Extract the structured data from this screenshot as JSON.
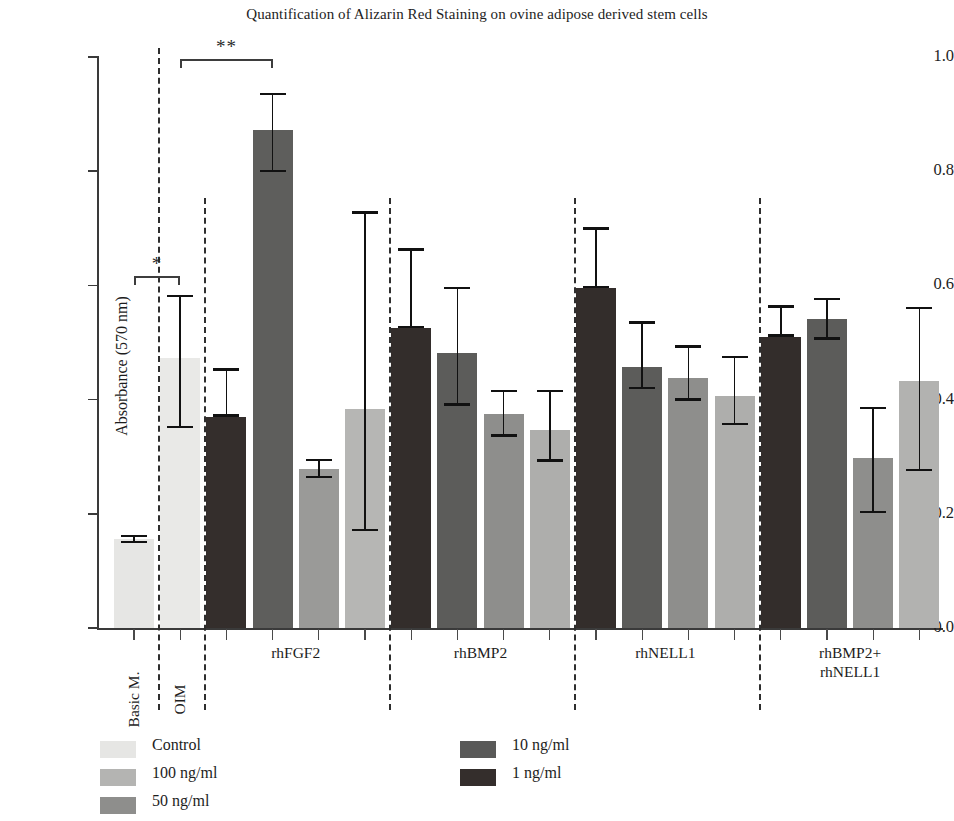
{
  "chart_data": {
    "type": "bar",
    "title": "Quantification of Alizarin Red Staining on ovine adipose derived stem cells",
    "xlabel": "",
    "ylabel": "Absorbance (570 nm)",
    "ylim": [
      0.0,
      1.0
    ],
    "ytick_labels": [
      "1.0",
      "0.8",
      "0.6",
      "0.4",
      "0.2",
      "0.0"
    ],
    "ytick_values": [
      1.0,
      0.8,
      0.6,
      0.4,
      0.2,
      0.0
    ],
    "grid": false,
    "legend_position": "bottom-left",
    "legend": [
      {
        "label": "Control",
        "color": "#e6e6e4"
      },
      {
        "label": "100 ng/ml",
        "color": "#b4b4b2"
      },
      {
        "label": "50 ng/ml",
        "color": "#8e8e8c"
      },
      {
        "label": "10 ng/ml",
        "color": "#595958"
      },
      {
        "label": "1 ng/ml",
        "color": "#342e2c"
      }
    ],
    "groups": [
      {
        "name": "Basic M.",
        "label_orientation": "vertical",
        "bars": [
          {
            "series": "Control",
            "value": 0.155,
            "err_low": 0.148,
            "err_high": 0.163,
            "color": "#e6e6e4"
          }
        ]
      },
      {
        "name": "OIM",
        "label_orientation": "vertical",
        "bars": [
          {
            "series": "Control",
            "value": 0.472,
            "err_low": 0.35,
            "err_high": 0.583,
            "color": "#e9e9e7"
          }
        ]
      },
      {
        "name": "rhFGF2",
        "label_orientation": "horizontal",
        "bars": [
          {
            "series": "1 ng/ml",
            "value": 0.37,
            "err_low": 0.37,
            "err_high": 0.455,
            "color": "#342e2c"
          },
          {
            "series": "50 ng/ml",
            "value": 0.872,
            "err_low": 0.798,
            "err_high": 0.937,
            "color": "#5e5e5c"
          },
          {
            "series": "100 ng/ml",
            "value": 0.279,
            "err_low": 0.262,
            "err_high": 0.296,
            "color": "#9a9a98"
          },
          {
            "series": "Control",
            "value": 0.383,
            "err_low": 0.17,
            "err_high": 0.73,
            "color": "#b6b6b4"
          }
        ]
      },
      {
        "name": "rhBMP2",
        "label_orientation": "horizontal",
        "bars": [
          {
            "series": "1 ng/ml",
            "value": 0.525,
            "err_low": 0.525,
            "err_high": 0.665,
            "color": "#332d2b"
          },
          {
            "series": "10 ng/ml",
            "value": 0.482,
            "err_low": 0.389,
            "err_high": 0.598,
            "color": "#5c5c5a"
          },
          {
            "series": "50 ng/ml",
            "value": 0.375,
            "err_low": 0.335,
            "err_high": 0.417,
            "color": "#8e8e8c"
          },
          {
            "series": "100 ng/ml",
            "value": 0.346,
            "err_low": 0.291,
            "err_high": 0.417,
            "color": "#aeaeac"
          }
        ]
      },
      {
        "name": "rhNELL1",
        "label_orientation": "horizontal",
        "bars": [
          {
            "series": "1 ng/ml",
            "value": 0.595,
            "err_low": 0.595,
            "err_high": 0.702,
            "color": "#332d2b"
          },
          {
            "series": "10 ng/ml",
            "value": 0.457,
            "err_low": 0.418,
            "err_high": 0.537,
            "color": "#5c5c5a"
          },
          {
            "series": "50 ng/ml",
            "value": 0.438,
            "err_low": 0.398,
            "err_high": 0.495,
            "color": "#8e8e8c"
          },
          {
            "series": "100 ng/ml",
            "value": 0.406,
            "err_low": 0.355,
            "err_high": 0.477,
            "color": "#aeaeac"
          }
        ]
      },
      {
        "name": "rhBMP2+\nrhNELL1",
        "label_orientation": "horizontal",
        "bars": [
          {
            "series": "1 ng/ml",
            "value": 0.51,
            "err_low": 0.51,
            "err_high": 0.565,
            "color": "#332d2b"
          },
          {
            "series": "10 ng/ml",
            "value": 0.541,
            "err_low": 0.505,
            "err_high": 0.578,
            "color": "#5c5c5a"
          },
          {
            "series": "50 ng/ml",
            "value": 0.297,
            "err_low": 0.201,
            "err_high": 0.387,
            "color": "#8e8e8c"
          },
          {
            "series": "100 ng/ml",
            "value": 0.432,
            "err_low": 0.275,
            "err_high": 0.562,
            "color": "#b2b2b0"
          }
        ]
      }
    ],
    "significance": [
      {
        "label": "*",
        "from_group": "Basic M.",
        "to_group": "OIM",
        "y": 0.616
      },
      {
        "label": "**",
        "from_group": "OIM",
        "to_group": "rhFGF2",
        "y": 0.996
      }
    ],
    "annotations": [
      "* p < 0.05 between Basic M. and OIM",
      "** p < 0.01 between OIM and rhFGF2 50 ng/ml"
    ]
  }
}
